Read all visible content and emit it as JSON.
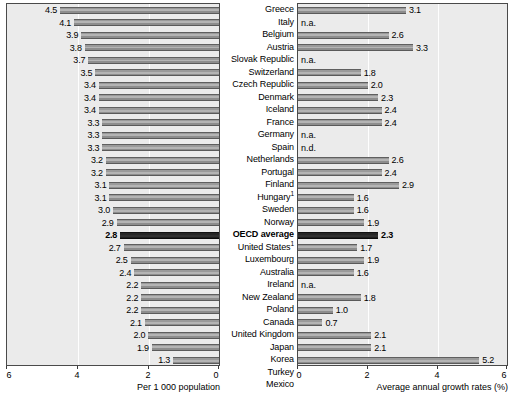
{
  "chart_data": {
    "type": "bar",
    "title": "",
    "panels": [
      {
        "name": "density",
        "xlabel": "Per 1 000 population",
        "xlim": [
          0,
          6
        ],
        "reversed": true,
        "ticks": [
          6,
          4,
          2,
          0
        ],
        "tick_labels": [
          "6",
          "4",
          "2",
          "0"
        ],
        "grid": true
      },
      {
        "name": "growth",
        "xlabel": "Average annual growth rates (%)",
        "xlim": [
          0,
          6
        ],
        "reversed": false,
        "ticks": [
          0,
          2,
          4,
          6
        ],
        "tick_labels": [
          "0",
          "2",
          "4",
          "6"
        ],
        "grid": true
      }
    ],
    "categories": [
      "Greece",
      "Italy",
      "Belgium",
      "Austria",
      "Slovak Republic",
      "Switzerland",
      "Czech Republic",
      "Denmark",
      "Iceland",
      "France",
      "Germany",
      "Spain",
      "Netherlands",
      "Portugal",
      "Finland",
      "Hungary",
      "Sweden",
      "Norway",
      "OECD average",
      "United States",
      "Luxembourg",
      "Australia",
      "Ireland",
      "New Zealand",
      "Poland",
      "Canada",
      "United Kingdom",
      "Japan",
      "Korea",
      "Turkey",
      "Mexico"
    ],
    "series": [
      {
        "name": "Per 1 000 population",
        "values": [
          4.5,
          4.1,
          3.9,
          3.8,
          3.7,
          3.5,
          3.4,
          3.4,
          3.4,
          3.3,
          3.3,
          3.3,
          3.2,
          3.2,
          3.1,
          3.1,
          3.0,
          2.9,
          2.8,
          2.7,
          2.5,
          2.4,
          2.2,
          2.2,
          2.2,
          2.1,
          2.0,
          1.9,
          1.3,
          1.3,
          1.1
        ],
        "labels": [
          "4.5",
          "4.1",
          "3.9",
          "3.8",
          "3.7",
          "3.5",
          "3.4",
          "3.4",
          "3.4",
          "3.3",
          "3.3",
          "3.3",
          "3.2",
          "3.2",
          "3.1",
          "3.1",
          "3.0",
          "2.9",
          "2.8",
          "2.7",
          "2.5",
          "2.4",
          "2.2",
          "2.2",
          "2.2",
          "2.1",
          "2.0",
          "1.9",
          "1.3",
          "1.3",
          "1.1"
        ]
      },
      {
        "name": "Average annual growth rates (%)",
        "values": [
          3.1,
          null,
          2.6,
          3.3,
          null,
          1.8,
          2.0,
          2.3,
          2.4,
          2.4,
          null,
          null,
          2.6,
          2.4,
          2.9,
          1.6,
          1.6,
          1.9,
          2.3,
          1.7,
          1.9,
          1.6,
          null,
          1.8,
          1.0,
          0.7,
          2.1,
          2.1,
          5.2,
          3.7,
          null
        ],
        "labels": [
          "3.1",
          "n.a.",
          "2.6",
          "3.3",
          "n.a.",
          "1.8",
          "2.0",
          "2.3",
          "2.4",
          "2.4",
          "n.a.",
          "n.d.",
          "2.6",
          "2.4",
          "2.9",
          "1.6",
          "1.6",
          "1.9",
          "2.3",
          "1.7",
          "1.9",
          "1.6",
          "n.a.",
          "1.8",
          "1.0",
          "0.7",
          "2.1",
          "2.1",
          "5.2",
          "3.7",
          "n.a."
        ]
      }
    ],
    "footnote_markers": {
      "Hungary": "1",
      "United States": "1"
    },
    "highlight_category": "OECD average",
    "colors": {
      "bar_fill": "#9a9a9a",
      "bar_highlight": "#1f1f1f",
      "panel_background": "#ebebeb",
      "panel_border": "#4a4a4a",
      "gridline": "#ffffff",
      "text": "#000000"
    }
  }
}
